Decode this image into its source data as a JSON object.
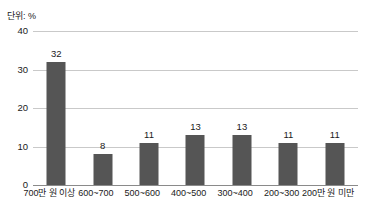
{
  "unit_label": "단위: %",
  "colors": {
    "bar": "#555555",
    "gridline": "#c9c9c9",
    "baseline": "#8a8a8a",
    "text": "#1a1a1a",
    "background": "#ffffff"
  },
  "chart_data": {
    "type": "bar",
    "title": "",
    "subtitle": "",
    "xlabel": "",
    "ylabel": "",
    "unit": "단위: %",
    "categories": [
      "700만 원 이상",
      "600~700",
      "500~600",
      "400~500",
      "300~400",
      "200~300",
      "200만 원 미만"
    ],
    "values": [
      32,
      8,
      11,
      13,
      13,
      11,
      11
    ],
    "data_labels": [
      "32",
      "8",
      "11",
      "13",
      "13",
      "11",
      "11"
    ],
    "ylim": [
      0,
      40
    ],
    "yticks": [
      0,
      10,
      20,
      30,
      40
    ],
    "ytick_labels": [
      "0",
      "10",
      "20",
      "30",
      "40"
    ],
    "grid": true,
    "legend": false,
    "legend_position": "none",
    "series": [
      {
        "name": "비율",
        "values": [
          32,
          8,
          11,
          13,
          13,
          11,
          11
        ]
      }
    ]
  }
}
